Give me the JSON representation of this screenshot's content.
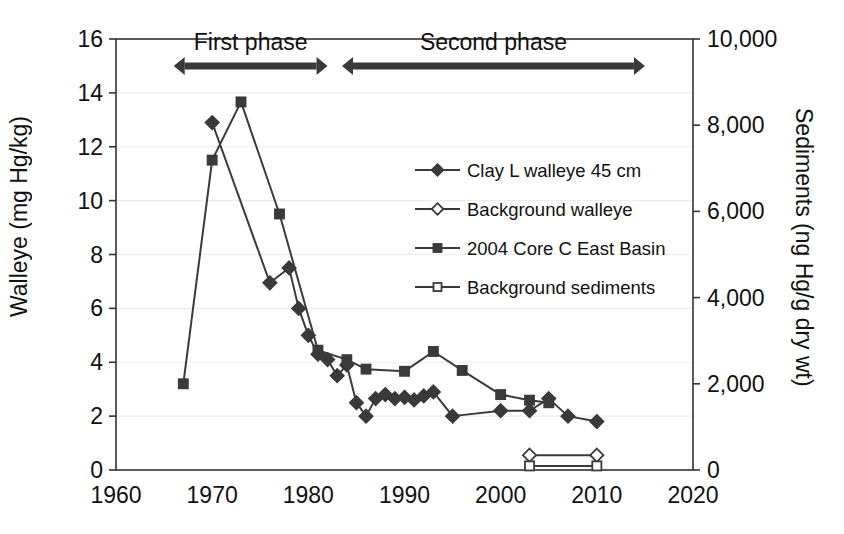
{
  "chart_data": {
    "type": "line",
    "title": "",
    "xlabel": "",
    "ylabel": "Walleye (mg Hg/kg)",
    "y2label": "Sediments (ng Hg/g dry wt)",
    "xlim": [
      1960,
      2020
    ],
    "ylim": [
      0,
      16
    ],
    "y2lim": [
      0,
      10000
    ],
    "xticks": [
      "1960",
      "1970",
      "1980",
      "1990",
      "2000",
      "2010",
      "2020"
    ],
    "xtick_values": [
      1960,
      1970,
      1980,
      1990,
      2000,
      2010,
      2020
    ],
    "yticks": [
      "0",
      "2",
      "4",
      "6",
      "8",
      "10",
      "12",
      "14",
      "16"
    ],
    "ytick_values": [
      0,
      2,
      4,
      6,
      8,
      10,
      12,
      14,
      16
    ],
    "y2ticks": [
      "0",
      "2,000",
      "4,000",
      "6,000",
      "8,000",
      "10,000"
    ],
    "y2tick_values": [
      0,
      2000,
      4000,
      6000,
      8000,
      10000
    ],
    "grid": true,
    "grid_axis": "y",
    "legend_position": "center",
    "series": [
      {
        "name": "Clay L walleye 45 cm",
        "axis": "left",
        "marker": "filled-diamond",
        "color": "#3a3a3a",
        "points": [
          [
            1970,
            12.9
          ],
          [
            1976,
            6.95
          ],
          [
            1978,
            7.5
          ],
          [
            1979,
            6.0
          ],
          [
            1980,
            5.0
          ],
          [
            1981,
            4.3
          ],
          [
            1982,
            4.1
          ],
          [
            1983,
            3.5
          ],
          [
            1984,
            3.9
          ],
          [
            1985,
            2.5
          ],
          [
            1986,
            2.0
          ],
          [
            1987,
            2.65
          ],
          [
            1988,
            2.8
          ],
          [
            1989,
            2.65
          ],
          [
            1990,
            2.7
          ],
          [
            1991,
            2.6
          ],
          [
            1992,
            2.75
          ],
          [
            1993,
            2.9
          ],
          [
            1995,
            2.0
          ],
          [
            2000,
            2.2
          ],
          [
            2003,
            2.2
          ],
          [
            2005,
            2.65
          ],
          [
            2007,
            2.0
          ],
          [
            2010,
            1.8
          ]
        ]
      },
      {
        "name": "Background walleye",
        "axis": "left",
        "marker": "open-diamond",
        "color": "#3a3a3a",
        "points": [
          [
            2003,
            0.55
          ],
          [
            2010,
            0.55
          ]
        ]
      },
      {
        "name": "2004 Core C East Basin",
        "axis": "right",
        "marker": "filled-square",
        "color": "#3a3a3a",
        "points": [
          [
            1967,
            2000
          ],
          [
            1970,
            7190
          ],
          [
            1973,
            8540
          ],
          [
            1977,
            5940
          ],
          [
            1981,
            2780
          ],
          [
            1984,
            2560
          ],
          [
            1986,
            2340
          ],
          [
            1990,
            2290
          ],
          [
            1993,
            2750
          ],
          [
            1996,
            2310
          ],
          [
            2000,
            1750
          ],
          [
            2003,
            1620
          ],
          [
            2005,
            1560
          ]
        ]
      },
      {
        "name": "Background sediments",
        "axis": "right",
        "marker": "open-square",
        "color": "#3a3a3a",
        "points": [
          [
            2003,
            95
          ],
          [
            2010,
            95
          ]
        ]
      }
    ],
    "annotations": [
      {
        "label": "First phase",
        "x_start": 1966,
        "x_end": 1982,
        "arrow": "double"
      },
      {
        "label": "Second phase",
        "x_start": 1983.5,
        "x_end": 2015,
        "arrow": "double"
      }
    ]
  }
}
